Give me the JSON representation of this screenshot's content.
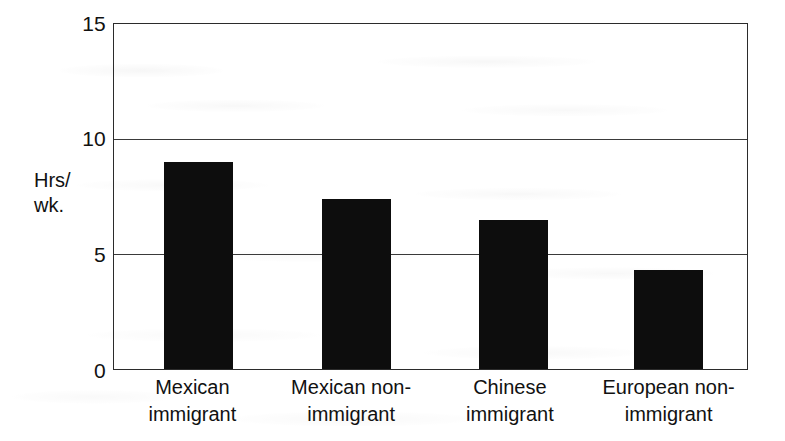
{
  "chart_data": {
    "type": "bar",
    "title": "",
    "subtitle": "",
    "xlabel": "",
    "ylabel": "Hrs/ wk.",
    "ylabel_lines": [
      "Hrs/",
      "wk."
    ],
    "categories": [
      "Mexican immigrant",
      "Mexican non-immigrant",
      "Chinese immigrant",
      "European non-immigrant"
    ],
    "category_lines": [
      [
        "Mexican",
        "immigrant"
      ],
      [
        "Mexican non-",
        "immigrant"
      ],
      [
        "Chinese",
        "immigrant"
      ],
      [
        "European non-",
        "immigrant"
      ]
    ],
    "values": [
      9.0,
      7.4,
      6.5,
      4.3
    ],
    "ylim": [
      0,
      15
    ],
    "yticks": [
      0,
      5,
      10,
      15
    ],
    "ytick_labels": [
      "0",
      "5",
      "10",
      "15"
    ],
    "grid": true,
    "grid_axis": "y",
    "legend": false,
    "bar_color": "#0d0d0d",
    "axis_color": "#2b2b2b",
    "grid_color": "#3a3a3a",
    "background_color": "#ffffff"
  }
}
